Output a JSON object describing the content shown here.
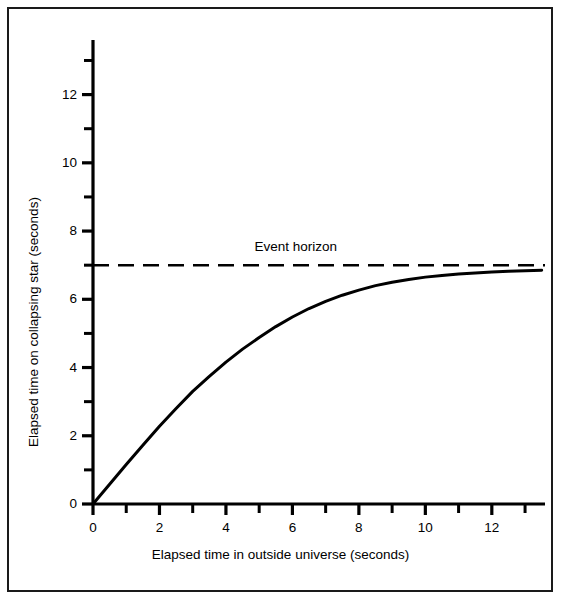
{
  "figure": {
    "background_color": "#ffffff",
    "line_color": "#000000",
    "frame_color": "#1a1a1a",
    "caption": ""
  },
  "chart_data": {
    "type": "line",
    "title": "",
    "xlabel": "Elapsed time in outside universe (seconds)",
    "ylabel": "Elapsed time on collapsing star (seconds)",
    "xlim": [
      0,
      13.6
    ],
    "ylim": [
      0,
      13.6
    ],
    "grid": false,
    "legend": "none",
    "xticks": [
      0,
      2,
      4,
      6,
      8,
      10,
      12
    ],
    "xtick_labels": [
      "0",
      "2",
      "4",
      "6",
      "8",
      "10",
      "12"
    ],
    "xminor_ticks": [
      1,
      3,
      5,
      7,
      9,
      11,
      13
    ],
    "yticks": [
      0,
      2,
      4,
      6,
      8,
      10,
      12
    ],
    "ytick_labels": [
      "0",
      "2",
      "4",
      "6",
      "8",
      "10",
      "12"
    ],
    "yminor_ticks": [
      1,
      3,
      5,
      7,
      9,
      11,
      13
    ],
    "series": [
      {
        "name": "Elapsed time on collapsing star",
        "style": "solid",
        "x": [
          0,
          0.5,
          1,
          1.5,
          2,
          2.5,
          3,
          3.5,
          4,
          4.5,
          5,
          5.5,
          6,
          6.5,
          7,
          7.5,
          8,
          8.5,
          9,
          9.5,
          10,
          10.5,
          11,
          11.5,
          12,
          12.5,
          13,
          13.5
        ],
        "values": [
          0,
          0.58,
          1.16,
          1.72,
          2.28,
          2.8,
          3.3,
          3.74,
          4.16,
          4.54,
          4.88,
          5.2,
          5.48,
          5.73,
          5.94,
          6.12,
          6.27,
          6.4,
          6.5,
          6.58,
          6.65,
          6.7,
          6.74,
          6.77,
          6.8,
          6.82,
          6.84,
          6.85
        ]
      },
      {
        "name": "Event horizon",
        "style": "dashed",
        "constant_y": 7,
        "x": [
          0,
          13.6
        ],
        "values": [
          7,
          7
        ]
      }
    ],
    "annotations": [
      {
        "text": "Event horizon",
        "x": 6.1,
        "y": 7.55
      }
    ]
  }
}
